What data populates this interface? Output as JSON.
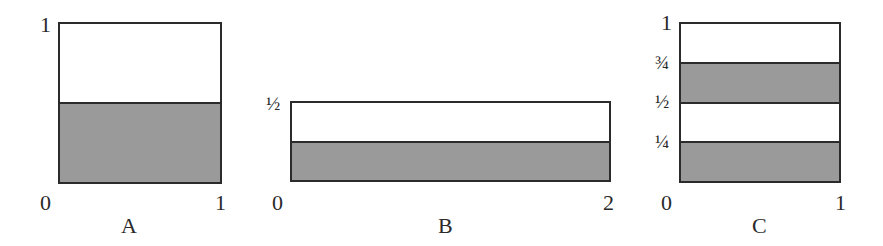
{
  "figure": {
    "panels": [
      {
        "name": "A",
        "x_ticks": [
          "0",
          "1"
        ],
        "y_ticks": [
          "1"
        ],
        "width": 1,
        "height": 1,
        "shaded_from": 0,
        "shaded_to": 0.5
      },
      {
        "name": "B",
        "x_ticks": [
          "0",
          "2"
        ],
        "y_ticks": [
          "½"
        ],
        "width": 2,
        "height": 0.5,
        "shaded_from": 0,
        "shaded_to": 0.25
      },
      {
        "name": "C",
        "x_ticks": [
          "0",
          "1"
        ],
        "y_ticks": [
          "1",
          "¾",
          "½",
          "¼"
        ],
        "width": 1,
        "height": 1,
        "shaded_bands": [
          [
            0,
            0.25
          ],
          [
            0.5,
            0.75
          ]
        ]
      }
    ],
    "colors": {
      "shade": "#9a9a9a",
      "outline": "#2b2b2b"
    }
  }
}
